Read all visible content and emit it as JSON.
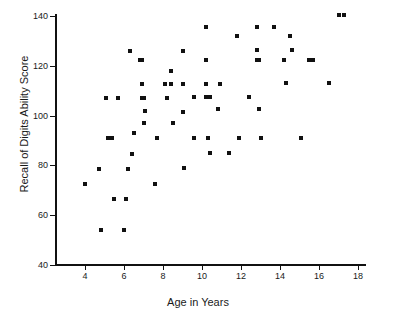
{
  "chart_data": {
    "type": "scatter",
    "title": "",
    "xlabel": "Age in Years",
    "ylabel": "Recall of Digits Ability Score",
    "xlim": [
      3.0,
      18.0
    ],
    "ylim": [
      40,
      140
    ],
    "xticks": [
      4,
      6,
      8,
      10,
      12,
      14,
      16,
      18
    ],
    "xtick_labels": [
      "4",
      "6",
      "8",
      "10",
      "12",
      "14",
      "16",
      "18"
    ],
    "yticks": [
      40,
      60,
      80,
      100,
      120,
      140
    ],
    "ytick_labels": [
      "40",
      "60",
      "80",
      "100",
      "120",
      "140"
    ],
    "grid": false,
    "legend": null,
    "marker": "square",
    "marker_color": "#111111",
    "points": [
      [
        4.0,
        72.5
      ],
      [
        4.7,
        78.5
      ],
      [
        4.8,
        54.0
      ],
      [
        5.1,
        107.0
      ],
      [
        5.2,
        91.0
      ],
      [
        5.4,
        91.0
      ],
      [
        5.5,
        66.5
      ],
      [
        5.7,
        107.0
      ],
      [
        6.0,
        54.0
      ],
      [
        6.1,
        66.5
      ],
      [
        6.2,
        78.5
      ],
      [
        6.3,
        126.0
      ],
      [
        6.4,
        84.5
      ],
      [
        6.5,
        93.0
      ],
      [
        6.8,
        122.5
      ],
      [
        6.9,
        122.5
      ],
      [
        6.9,
        112.5
      ],
      [
        6.9,
        107.0
      ],
      [
        7.0,
        107.0
      ],
      [
        7.0,
        97.0
      ],
      [
        7.1,
        102.0
      ],
      [
        7.6,
        72.5
      ],
      [
        7.7,
        91.0
      ],
      [
        8.1,
        112.5
      ],
      [
        8.2,
        107.0
      ],
      [
        8.4,
        112.5
      ],
      [
        8.4,
        118.0
      ],
      [
        8.5,
        97.0
      ],
      [
        9.0,
        126.0
      ],
      [
        9.0,
        112.5
      ],
      [
        9.0,
        101.5
      ],
      [
        9.1,
        79.0
      ],
      [
        9.6,
        107.5
      ],
      [
        9.6,
        91.0
      ],
      [
        10.2,
        135.5
      ],
      [
        10.2,
        122.5
      ],
      [
        10.2,
        112.5
      ],
      [
        10.2,
        107.5
      ],
      [
        10.3,
        91.0
      ],
      [
        10.4,
        107.5
      ],
      [
        10.4,
        85.0
      ],
      [
        10.8,
        102.5
      ],
      [
        10.9,
        112.5
      ],
      [
        11.4,
        85.0
      ],
      [
        11.8,
        132.0
      ],
      [
        11.9,
        91.0
      ],
      [
        12.4,
        107.5
      ],
      [
        12.8,
        135.5
      ],
      [
        12.8,
        126.5
      ],
      [
        12.8,
        122.5
      ],
      [
        12.9,
        122.5
      ],
      [
        12.9,
        102.5
      ],
      [
        13.0,
        91.0
      ],
      [
        13.7,
        135.5
      ],
      [
        14.2,
        122.5
      ],
      [
        14.3,
        113.0
      ],
      [
        14.5,
        132.0
      ],
      [
        14.6,
        126.5
      ],
      [
        15.1,
        91.0
      ],
      [
        15.5,
        122.5
      ],
      [
        15.7,
        122.5
      ],
      [
        16.5,
        113.0
      ],
      [
        17.0,
        140.5
      ],
      [
        17.3,
        140.5
      ]
    ]
  },
  "axes": {
    "y_title": "Recall of Digits Ability Score",
    "x_title": "Age in Years"
  }
}
